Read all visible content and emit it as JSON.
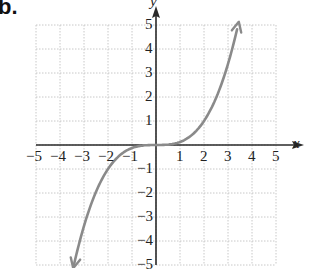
{
  "part_label": "b.",
  "chart_data": {
    "type": "line",
    "title": "",
    "function": "y = x^3 / 8",
    "xlabel": "x",
    "ylabel": "y",
    "xlim": [
      -5,
      5
    ],
    "ylim": [
      -5,
      5
    ],
    "grid": true,
    "x_ticks": [
      "-5",
      "-4",
      "-3",
      "-2",
      "-1",
      "1",
      "2",
      "3",
      "4",
      "5"
    ],
    "y_ticks": [
      "5",
      "4",
      "3",
      "2",
      "1",
      "-1",
      "-2",
      "-3",
      "-4",
      "-5"
    ],
    "series": [
      {
        "name": "curve",
        "color": "#8a8a8a",
        "x": [
          -3.45,
          -3,
          -2.5,
          -2,
          -1.5,
          -1,
          -0.5,
          0,
          0.5,
          1,
          1.5,
          2,
          2.5,
          3,
          3.45
        ],
        "y": [
          -5.13,
          -3.38,
          -1.95,
          -1.0,
          -0.42,
          -0.13,
          -0.02,
          0,
          0.02,
          0.13,
          0.42,
          1.0,
          1.95,
          3.38,
          5.13
        ],
        "arrows": "both"
      }
    ]
  },
  "colors": {
    "axis": "#2a2a2a",
    "grid": "#c8c8c8",
    "curve": "#8a8a8a"
  }
}
